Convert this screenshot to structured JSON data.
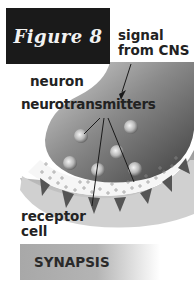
{
  "figure": {
    "title": "Figure 8",
    "labels": {
      "signal": [
        "signal",
        "from CNS"
      ],
      "neuron": "neuron",
      "neurotransmitters": "neurotransmitters",
      "receptor": [
        "receptor",
        "cell"
      ]
    },
    "footer": "SYNAPSIS"
  },
  "colors": {
    "title_bg": "#1a1a1a",
    "title_text": "#f2f2f2",
    "neuron_dark": "#4a4a4a",
    "neuron_light": "#b0b0b0",
    "receptor_fill": "#c8c8c8",
    "spike_fill": "#555555",
    "label_text": "#222222"
  }
}
